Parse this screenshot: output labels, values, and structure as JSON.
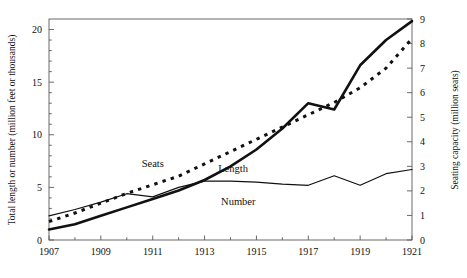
{
  "chart_data": {
    "type": "line",
    "title": "",
    "xlabel": "",
    "ylabel": "Total length or number (million feet or thousands)",
    "y2label": "Seating capacity (million seats)",
    "xlim": [
      1907,
      1921
    ],
    "ylim": [
      0,
      21
    ],
    "y2lim": [
      0,
      9
    ],
    "grid": false,
    "legend_position": "inline-annotations",
    "x_ticks": [
      1907,
      1909,
      1911,
      1913,
      1915,
      1917,
      1919,
      1921
    ],
    "x_tick_labels": [
      "1907",
      "1909",
      "1911",
      "1913",
      "1915",
      "1917",
      "1919",
      "1921"
    ],
    "x_minor_ticks": [
      1908,
      1910,
      1912,
      1914,
      1916,
      1918,
      1920
    ],
    "y_ticks": [
      0,
      5,
      10,
      15,
      20
    ],
    "y_tick_labels": [
      "0",
      "5",
      "10",
      "15",
      "20"
    ],
    "y2_ticks": [
      0,
      1,
      2,
      3,
      4,
      5,
      6,
      7,
      8,
      9
    ],
    "y2_tick_labels": [
      "0",
      "1",
      "2",
      "3",
      "4",
      "5",
      "6",
      "7",
      "8",
      "9"
    ],
    "x": [
      1907,
      1908,
      1909,
      1910,
      1911,
      1912,
      1913,
      1914,
      1915,
      1916,
      1917,
      1918,
      1919,
      1920,
      1921
    ],
    "series": [
      {
        "name": "Length",
        "label": "Length",
        "axis": "left",
        "style": "thick-solid",
        "values": [
          1.0,
          1.5,
          2.3,
          3.1,
          3.9,
          4.7,
          5.7,
          7.0,
          8.6,
          10.6,
          13.0,
          12.4,
          16.6,
          19.0,
          20.8
        ]
      },
      {
        "name": "Number",
        "label": "Number",
        "axis": "left",
        "style": "thin-solid",
        "values": [
          2.3,
          2.9,
          3.6,
          4.4,
          4.1,
          5.0,
          5.6,
          5.6,
          5.5,
          5.3,
          5.2,
          6.1,
          5.2,
          6.3,
          6.7
        ]
      },
      {
        "name": "Seats",
        "label": "Seats",
        "axis": "right",
        "style": "dotted",
        "values": [
          0.75,
          1.1,
          1.5,
          1.9,
          2.25,
          2.6,
          3.1,
          3.6,
          4.1,
          4.6,
          5.1,
          5.6,
          6.2,
          7.0,
          8.2
        ]
      }
    ],
    "annotations": [
      {
        "text": "Seats",
        "x": 1911.0,
        "y_left": 6.9
      },
      {
        "text": "Length",
        "x": 1914.1,
        "y_left": 6.5
      },
      {
        "text": "Number",
        "x": 1914.3,
        "y_left": 3.3
      }
    ]
  }
}
